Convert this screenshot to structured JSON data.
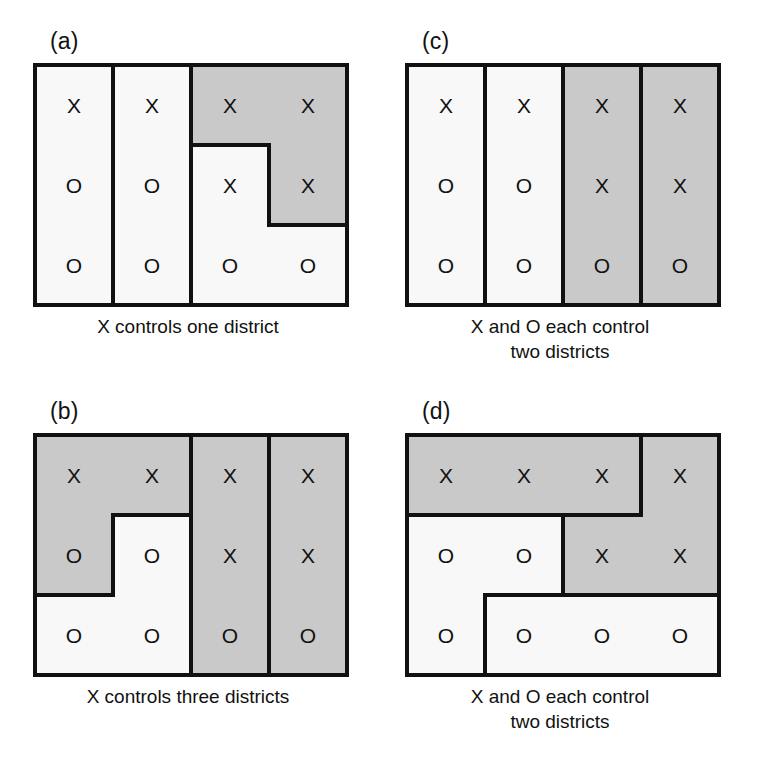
{
  "figure": {
    "grid": {
      "columns": 4,
      "rows": 3
    },
    "colors": {
      "x_district_fill": "#c9c9c9",
      "o_district_fill": "#f8f8f8",
      "border": "#111111",
      "background": "#ffffff"
    },
    "voter_symbols": {
      "x": "X",
      "o": "O"
    },
    "voter_grid": [
      [
        "X",
        "X",
        "X",
        "X"
      ],
      [
        "O",
        "O",
        "X",
        "X"
      ],
      [
        "O",
        "O",
        "O",
        "O"
      ]
    ],
    "panels": [
      {
        "id": "a",
        "label": "(a)",
        "caption_lines": [
          "X controls one district",
          ""
        ],
        "x_districts": 1,
        "o_districts": 2,
        "districts": [
          {
            "name": "column-one",
            "winner": "O",
            "cells": [
              [
                0,
                0
              ],
              [
                1,
                0
              ],
              [
                2,
                0
              ]
            ],
            "outline": "M 0,0 L 78,0 L 78,240 L 0,240 Z"
          },
          {
            "name": "column-two",
            "winner": "O",
            "cells": [
              [
                0,
                1
              ],
              [
                1,
                1
              ],
              [
                2,
                1
              ]
            ],
            "outline": "M 78,0 L 156,0 L 156,240 L 78,240 Z"
          },
          {
            "name": "upper-right-L",
            "winner": "X",
            "cells": [
              [
                0,
                2
              ],
              [
                0,
                3
              ],
              [
                1,
                3
              ]
            ],
            "outline": "M 156,0 L 312,0 L 312,160 L 234,160 L 234,80 L 156,80 Z"
          },
          {
            "name": "lower-right-L",
            "winner": "O",
            "cells": [
              [
                1,
                2
              ],
              [
                2,
                2
              ],
              [
                2,
                3
              ]
            ],
            "outline": "M 156,80 L 234,80 L 234,160 L 312,160 L 312,240 L 156,240 Z"
          }
        ]
      },
      {
        "id": "b",
        "label": "(b)",
        "caption_lines": [
          "X controls three districts",
          ""
        ],
        "x_districts": 3,
        "o_districts": 1,
        "districts": [
          {
            "name": "upper-left-L",
            "winner": "X",
            "cells": [
              [
                0,
                0
              ],
              [
                0,
                1
              ],
              [
                1,
                0
              ]
            ],
            "outline": "M 0,0 L 156,0 L 156,80 L 78,80 L 78,160 L 0,160 Z"
          },
          {
            "name": "lower-left-region",
            "winner": "O",
            "cells": [
              [
                1,
                1
              ],
              [
                2,
                0
              ],
              [
                2,
                1
              ]
            ],
            "outline": "M 78,80 L 156,80 L 156,240 L 0,240 L 0,160 L 78,160 Z"
          },
          {
            "name": "column-three",
            "winner": "X",
            "cells": [
              [
                0,
                2
              ],
              [
                1,
                2
              ],
              [
                2,
                2
              ]
            ],
            "outline": "M 156,0 L 234,0 L 234,240 L 156,240 Z"
          },
          {
            "name": "column-four",
            "winner": "X",
            "cells": [
              [
                0,
                3
              ],
              [
                1,
                3
              ],
              [
                2,
                3
              ]
            ],
            "outline": "M 234,0 L 312,0 L 312,240 L 234,240 Z"
          }
        ]
      },
      {
        "id": "c",
        "label": "(c)",
        "caption_lines": [
          "X and O each control",
          "two districts"
        ],
        "x_districts": 2,
        "o_districts": 2,
        "districts": [
          {
            "name": "column-one",
            "winner": "O",
            "cells": [
              [
                0,
                0
              ],
              [
                1,
                0
              ],
              [
                2,
                0
              ]
            ],
            "outline": "M 0,0 L 78,0 L 78,240 L 0,240 Z"
          },
          {
            "name": "column-two",
            "winner": "O",
            "cells": [
              [
                0,
                1
              ],
              [
                1,
                1
              ],
              [
                2,
                1
              ]
            ],
            "outline": "M 78,0 L 156,0 L 156,240 L 78,240 Z"
          },
          {
            "name": "column-three",
            "winner": "X",
            "cells": [
              [
                0,
                2
              ],
              [
                1,
                2
              ],
              [
                2,
                2
              ]
            ],
            "outline": "M 156,0 L 234,0 L 234,240 L 156,240 Z"
          },
          {
            "name": "column-four",
            "winner": "X",
            "cells": [
              [
                0,
                3
              ],
              [
                1,
                3
              ],
              [
                2,
                3
              ]
            ],
            "outline": "M 234,0 L 312,0 L 312,240 L 234,240 Z"
          }
        ]
      },
      {
        "id": "d",
        "label": "(d)",
        "caption_lines": [
          "X and O each control",
          "two districts"
        ],
        "x_districts": 2,
        "o_districts": 2,
        "districts": [
          {
            "name": "top-strip",
            "winner": "X",
            "cells": [
              [
                0,
                0
              ],
              [
                0,
                1
              ],
              [
                0,
                2
              ]
            ],
            "outline": "M 0,0 L 234,0 L 234,80 L 0,80 Z"
          },
          {
            "name": "right-block",
            "winner": "X",
            "cells": [
              [
                0,
                3
              ],
              [
                1,
                2
              ],
              [
                1,
                3
              ]
            ],
            "outline": "M 234,0 L 312,0 L 312,160 L 156,160 L 156,80 L 234,80 Z"
          },
          {
            "name": "left-block",
            "winner": "O",
            "cells": [
              [
                1,
                0
              ],
              [
                1,
                1
              ],
              [
                2,
                0
              ]
            ],
            "outline": "M 0,80 L 156,80 L 156,160 L 78,160 L 78,240 L 0,240 Z"
          },
          {
            "name": "bottom-strip",
            "winner": "O",
            "cells": [
              [
                2,
                1
              ],
              [
                2,
                2
              ],
              [
                2,
                3
              ]
            ],
            "outline": "M 78,160 L 312,160 L 312,240 L 78,240 Z"
          }
        ]
      }
    ]
  }
}
